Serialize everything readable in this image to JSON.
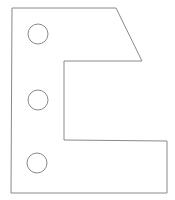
{
  "diagram": {
    "stroke_color": "#8a8a8a",
    "background": "#ffffff",
    "plate_outline": {
      "points": [
        [
          12,
          8
        ],
        [
          116,
          8
        ],
        [
          142,
          61
        ],
        [
          64,
          61
        ],
        [
          64,
          140
        ],
        [
          167,
          141
        ],
        [
          167,
          193
        ],
        [
          11,
          193
        ]
      ]
    },
    "holes": [
      {
        "cx": 38,
        "cy": 34,
        "r": 10
      },
      {
        "cx": 38,
        "cy": 100,
        "r": 10
      },
      {
        "cx": 37,
        "cy": 163,
        "r": 10
      }
    ]
  }
}
